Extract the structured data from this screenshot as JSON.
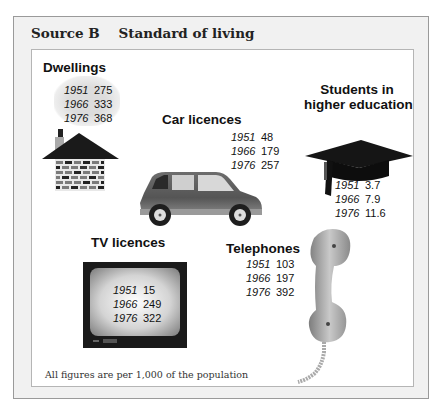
{
  "source": {
    "title": "Source B    Standard of living",
    "footnote": "All figures are per 1,000 of the population"
  },
  "panels": {
    "dwellings": {
      "heading": "Dwellings",
      "icon": "house-icon",
      "rows": [
        {
          "year": "1951",
          "value": "275"
        },
        {
          "year": "1966",
          "value": "333"
        },
        {
          "year": "1976",
          "value": "368"
        }
      ]
    },
    "cars": {
      "heading": "Car licences",
      "icon": "car-icon",
      "rows": [
        {
          "year": "1951",
          "value": "48"
        },
        {
          "year": "1966",
          "value": "179"
        },
        {
          "year": "1976",
          "value": "257"
        }
      ]
    },
    "students": {
      "heading_line1": "Students in",
      "heading_line2": "higher education",
      "icon": "graduation-cap-icon",
      "rows": [
        {
          "year": "1951",
          "value": "3.7"
        },
        {
          "year": "1966",
          "value": "7.9"
        },
        {
          "year": "1976",
          "value": "11.6"
        }
      ]
    },
    "tv": {
      "heading": "TV licences",
      "icon": "television-icon",
      "rows": [
        {
          "year": "1951",
          "value": "15"
        },
        {
          "year": "1966",
          "value": "249"
        },
        {
          "year": "1976",
          "value": "322"
        }
      ]
    },
    "telephones": {
      "heading": "Telephones",
      "icon": "telephone-handset-icon",
      "rows": [
        {
          "year": "1951",
          "value": "103"
        },
        {
          "year": "1966",
          "value": "197"
        },
        {
          "year": "1976",
          "value": "392"
        }
      ]
    }
  }
}
